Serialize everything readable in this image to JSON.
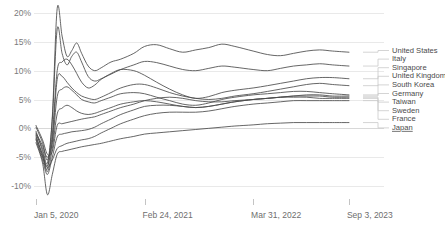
{
  "chart_data": {
    "type": "line",
    "title": "",
    "subtitle": "",
    "xlabel": "",
    "ylabel": "",
    "grid": true,
    "legend_position": "right",
    "ylim": [
      -12,
      22
    ],
    "yticks": [
      "20%",
      "15%",
      "10%",
      "5%",
      "0%",
      "-5%",
      "-10%"
    ],
    "ytick_values": [
      20,
      15,
      10,
      5,
      0,
      -5,
      -10
    ],
    "xticks": [
      "Jan 5, 2020",
      "Feb 24, 2021",
      "Mar 31, 2022",
      "Sep 3, 2023"
    ],
    "xtick_positions": [
      0,
      0.333,
      0.666,
      0.96
    ],
    "x": [
      0,
      0.02,
      0.035,
      0.05,
      0.065,
      0.08,
      0.095,
      0.11,
      0.125,
      0.14,
      0.16,
      0.18,
      0.2,
      0.23,
      0.26,
      0.3,
      0.333,
      0.37,
      0.41,
      0.45,
      0.49,
      0.53,
      0.57,
      0.61,
      0.666,
      0.71,
      0.75,
      0.79,
      0.83,
      0.87,
      0.91,
      0.96
    ],
    "series": [
      {
        "name": "United States",
        "values": [
          -1.0,
          -3.5,
          -6.0,
          2.0,
          20.8,
          16.0,
          12.5,
          13.5,
          14.8,
          13.0,
          10.8,
          10.0,
          10.5,
          11.5,
          12.0,
          13.0,
          14.2,
          14.5,
          13.8,
          13.2,
          13.6,
          14.0,
          14.6,
          14.2,
          13.4,
          12.8,
          12.6,
          13.0,
          13.4,
          13.6,
          13.4,
          13.2
        ]
      },
      {
        "name": "Italy",
        "values": [
          -0.5,
          -4.0,
          -7.0,
          1.5,
          17.2,
          13.0,
          11.0,
          12.5,
          13.2,
          11.5,
          9.0,
          8.2,
          8.6,
          9.4,
          10.2,
          11.0,
          11.6,
          11.4,
          10.8,
          10.2,
          10.0,
          10.4,
          10.8,
          10.6,
          10.2,
          10.0,
          10.4,
          10.8,
          11.0,
          11.2,
          11.0,
          10.8
        ]
      },
      {
        "name": "Singapore",
        "values": [
          0.2,
          -2.5,
          -5.5,
          -1.0,
          10.0,
          11.5,
          12.0,
          11.0,
          9.5,
          8.0,
          7.0,
          7.5,
          8.5,
          9.5,
          10.2,
          10.0,
          9.2,
          8.0,
          6.8,
          5.8,
          5.2,
          5.5,
          6.2,
          6.6,
          7.0,
          7.4,
          7.8,
          8.2,
          8.6,
          8.8,
          8.8,
          8.6
        ]
      },
      {
        "name": "United Kingdom",
        "values": [
          -1.5,
          -4.5,
          -6.5,
          -2.0,
          8.5,
          9.0,
          8.0,
          7.0,
          6.2,
          5.6,
          5.2,
          5.0,
          5.4,
          6.2,
          7.0,
          7.6,
          7.6,
          7.0,
          6.2,
          5.6,
          5.2,
          5.0,
          5.2,
          5.6,
          6.0,
          6.4,
          6.8,
          7.2,
          7.6,
          7.8,
          7.6,
          7.4
        ]
      },
      {
        "name": "South Korea",
        "values": [
          -0.8,
          -3.0,
          -5.0,
          -2.5,
          5.5,
          6.8,
          7.2,
          6.6,
          5.8,
          5.0,
          4.6,
          4.4,
          4.8,
          5.4,
          6.0,
          6.2,
          6.0,
          5.4,
          4.8,
          4.2,
          4.0,
          4.4,
          5.0,
          5.4,
          5.8,
          6.0,
          6.2,
          6.4,
          6.4,
          6.2,
          6.0,
          5.8
        ]
      },
      {
        "name": "Germany",
        "values": [
          -1.2,
          -4.8,
          -7.5,
          -3.5,
          2.5,
          3.5,
          4.0,
          3.6,
          3.0,
          2.6,
          2.4,
          2.6,
          3.0,
          3.6,
          4.2,
          4.6,
          4.8,
          4.6,
          4.2,
          3.8,
          3.6,
          3.8,
          4.2,
          4.6,
          5.0,
          5.2,
          5.4,
          5.6,
          5.8,
          5.8,
          5.6,
          5.6
        ]
      },
      {
        "name": "Taiwan",
        "values": [
          0.5,
          -2.0,
          -4.5,
          -4.0,
          0.5,
          0.8,
          1.0,
          1.2,
          1.4,
          1.6,
          1.8,
          2.0,
          2.4,
          3.0,
          3.6,
          4.2,
          4.8,
          5.2,
          5.4,
          5.2,
          4.8,
          4.6,
          4.6,
          4.8,
          5.0,
          5.2,
          5.4,
          5.6,
          5.6,
          5.6,
          5.4,
          5.4
        ]
      },
      {
        "name": "Sweden",
        "values": [
          -2.0,
          -5.5,
          -8.0,
          -5.0,
          -1.5,
          -1.0,
          -0.8,
          -0.6,
          -0.5,
          -0.4,
          -0.2,
          0.2,
          0.8,
          1.6,
          2.4,
          3.2,
          3.8,
          4.0,
          4.0,
          3.8,
          3.6,
          3.8,
          4.2,
          4.6,
          5.0,
          5.2,
          5.4,
          5.4,
          5.4,
          5.2,
          5.2,
          5.2
        ]
      },
      {
        "name": "France",
        "values": [
          -1.8,
          -5.0,
          -6.8,
          -5.5,
          -3.5,
          -3.0,
          -2.6,
          -2.4,
          -2.2,
          -2.0,
          -1.8,
          -1.4,
          -0.8,
          0.0,
          0.8,
          1.6,
          2.2,
          2.6,
          2.8,
          2.8,
          2.8,
          3.0,
          3.4,
          3.8,
          4.2,
          4.4,
          4.6,
          4.8,
          4.8,
          4.8,
          4.8,
          4.8
        ]
      },
      {
        "name": "Japan",
        "values": [
          -2.5,
          -6.0,
          -11.5,
          -8.0,
          -4.5,
          -4.0,
          -3.8,
          -3.6,
          -3.4,
          -3.2,
          -3.0,
          -2.8,
          -2.6,
          -2.2,
          -1.8,
          -1.4,
          -1.0,
          -0.8,
          -0.6,
          -0.4,
          -0.2,
          0.0,
          0.2,
          0.4,
          0.6,
          0.8,
          0.9,
          1.0,
          1.0,
          1.0,
          1.0,
          1.0
        ]
      }
    ],
    "legend_entries": [
      {
        "label": "United States",
        "linked": false
      },
      {
        "label": "Italy",
        "linked": false
      },
      {
        "label": "Singapore",
        "linked": false
      },
      {
        "label": "United Kingdom",
        "linked": false
      },
      {
        "label": "South Korea",
        "linked": false
      },
      {
        "label": "Germany",
        "linked": false
      },
      {
        "label": "Taiwan",
        "linked": false
      },
      {
        "label": "Sweden",
        "linked": false
      },
      {
        "label": "France",
        "linked": false
      },
      {
        "label": "Japan",
        "linked": true
      }
    ],
    "colors": {
      "line": "#4a4a4a",
      "grid": "#e9e9e9",
      "zero_axis": "#d8d8d8",
      "tick_text": "#7a7a7a",
      "legend_text": "#4a4a4a",
      "leader": "#c9c9c9",
      "background": "#ffffff"
    }
  }
}
